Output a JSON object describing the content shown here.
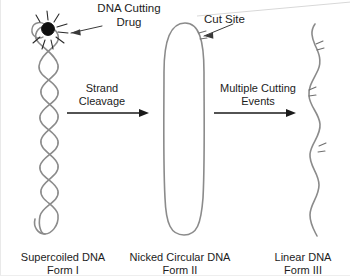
{
  "figure": {
    "background_color": "#ffffff",
    "dna_stroke_color": "#8b8b8b",
    "text_color": "#1c1c1c",
    "arrow_color": "#1a1a1a",
    "drug_color": "#111111"
  },
  "callouts": {
    "drug_label": "DNA Cutting\nDrug",
    "cut_site_label": "Cut Site"
  },
  "processes": [
    {
      "label": "Strand\nCleavage"
    },
    {
      "label": "Multiple Cutting\nEvents"
    }
  ],
  "forms": [
    {
      "name": "Supercoiled DNA\nForm I",
      "title": "Supercoiled DNA",
      "form_number": "Form I",
      "shape": "supercoiled-twist"
    },
    {
      "name": "Nicked Circular DNA\nForm II",
      "title": "Nicked Circular DNA",
      "form_number": "Form II",
      "shape": "relaxed-circle"
    },
    {
      "name": "Linear DNA\nForm III",
      "title": "Linear DNA",
      "form_number": "Form III",
      "shape": "linear-strand"
    }
  ],
  "icons": {
    "drug": "drug-molecule-icon",
    "sparkle": "sparkle-burst-icon",
    "arrow": "right-arrow-icon",
    "nick": "nick-tick-icon"
  }
}
